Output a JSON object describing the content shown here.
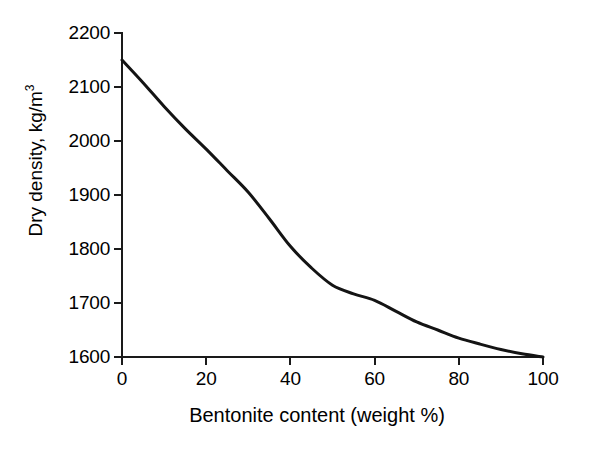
{
  "chart_data": {
    "type": "line",
    "title": "",
    "subtitle": "",
    "xlabel": "Bentonite content (weight %)",
    "ylabel": "Dry density, kg/m",
    "ylabel_superscript": "3",
    "ylabel_full": "Dry density, kg/m3",
    "xlim": [
      0,
      100
    ],
    "ylim": [
      1600,
      2200
    ],
    "xticks": [
      0,
      20,
      40,
      60,
      80,
      100
    ],
    "xtick_labels": [
      "0",
      "20",
      "40",
      "60",
      "80",
      "100"
    ],
    "yticks": [
      1600,
      1700,
      1800,
      1900,
      2000,
      2100,
      2200
    ],
    "ytick_labels": [
      "1600",
      "1700",
      "1800",
      "1900",
      "2000",
      "2100",
      "2200"
    ],
    "grid": false,
    "legend": false,
    "legend_position": "none",
    "spines": [
      "left",
      "bottom"
    ],
    "tick_direction": "out",
    "series": [
      {
        "name": "Dry density vs bentonite content",
        "color": "#141414",
        "line_width": 3,
        "marker": "none",
        "x": [
          0,
          5,
          10,
          15,
          20,
          25,
          30,
          35,
          40,
          45,
          50,
          55,
          60,
          65,
          70,
          75,
          80,
          85,
          90,
          95,
          100
        ],
        "values": [
          2150,
          2108,
          2064,
          2023,
          1985,
          1945,
          1905,
          1856,
          1805,
          1765,
          1733,
          1717,
          1705,
          1685,
          1665,
          1650,
          1635,
          1624,
          1614,
          1606,
          1600
        ]
      }
    ],
    "annotations": []
  },
  "figure": {
    "background_color": "#ffffff",
    "axis_color": "#1a1a1a",
    "text_color": "#000000"
  }
}
